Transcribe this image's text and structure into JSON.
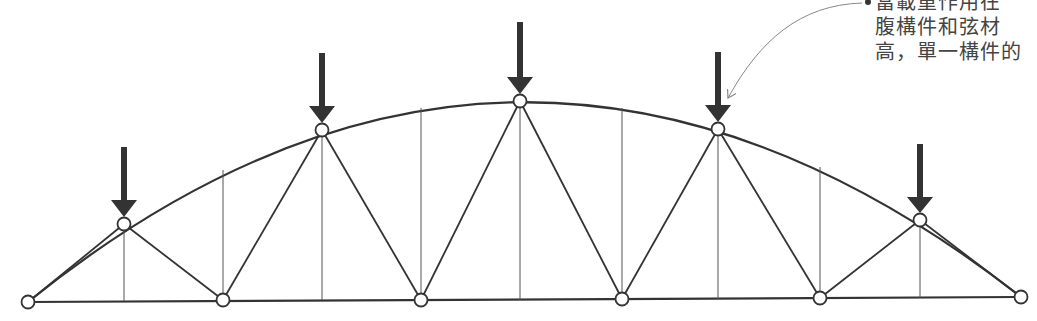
{
  "figure": {
    "type": "arched-truss-diagram",
    "colors": {
      "member": "#333333",
      "load_arrow": "#333333",
      "node_fill": "#ffffff",
      "annotation_text": "#444444",
      "leader_line": "#888888"
    }
  },
  "annotation": {
    "lines": [
      "當載重作用在",
      "腹構件和弦材",
      "高，單一構件的"
    ]
  },
  "truss": {
    "top_chord_nodes": [
      {
        "x": 28,
        "y": 302
      },
      {
        "x": 124,
        "y": 224
      },
      {
        "x": 322,
        "y": 130
      },
      {
        "x": 520,
        "y": 101
      },
      {
        "x": 718,
        "y": 129
      },
      {
        "x": 920,
        "y": 220
      },
      {
        "x": 1021,
        "y": 297
      }
    ],
    "bottom_chord_nodes": [
      {
        "x": 28,
        "y": 302
      },
      {
        "x": 223,
        "y": 300
      },
      {
        "x": 421,
        "y": 300
      },
      {
        "x": 622,
        "y": 299
      },
      {
        "x": 820,
        "y": 298
      },
      {
        "x": 1021,
        "y": 297
      }
    ],
    "verticals": [
      {
        "x": 124,
        "top": 224,
        "bottom": 301
      },
      {
        "x": 223,
        "top": 170,
        "bottom": 300
      },
      {
        "x": 322,
        "top": 130,
        "bottom": 300
      },
      {
        "x": 421,
        "top": 108,
        "bottom": 300
      },
      {
        "x": 520,
        "top": 101,
        "bottom": 300
      },
      {
        "x": 622,
        "top": 108,
        "bottom": 299
      },
      {
        "x": 718,
        "top": 129,
        "bottom": 299
      },
      {
        "x": 820,
        "top": 167,
        "bottom": 298
      },
      {
        "x": 920,
        "top": 220,
        "bottom": 298
      }
    ],
    "load_arrows": [
      {
        "x": 124,
        "top": 147,
        "tip": 217
      },
      {
        "x": 322,
        "top": 53,
        "tip": 123
      },
      {
        "x": 520,
        "top": 22,
        "tip": 94
      },
      {
        "x": 718,
        "top": 52,
        "tip": 122
      },
      {
        "x": 920,
        "top": 144,
        "tip": 213
      }
    ]
  }
}
